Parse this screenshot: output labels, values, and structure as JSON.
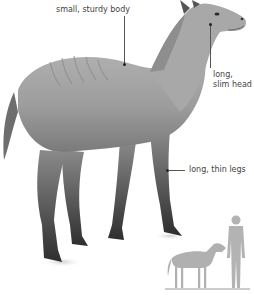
{
  "diagram": {
    "labels": {
      "body": "small, sturdy body",
      "head_line1": "long,",
      "head_line2": "slim head",
      "legs": "long, thin legs"
    },
    "scale_figure": {
      "animal": "small horse silhouette",
      "human": "human silhouette"
    },
    "colors": {
      "label_text": "#444444",
      "leader_line": "#555555",
      "animal_body": "#9a9a9a",
      "animal_dark": "#3a3a3a",
      "silhouette": "#b3b3b3",
      "background": "#ffffff"
    }
  }
}
